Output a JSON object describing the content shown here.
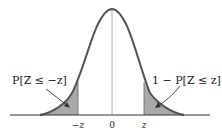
{
  "diagram": {
    "type": "standard-normal-curve",
    "left_tail_label": "P[Z ≤ −z]",
    "right_tail_label": "1 − P[Z ≤ z]",
    "axis_ticks": [
      {
        "label": "−z",
        "x": 78
      },
      {
        "label": "0",
        "x": 112
      },
      {
        "label": "z",
        "x": 144
      }
    ],
    "colors": {
      "curve": "#555555",
      "shade": "#a9a9a9",
      "axis": "#333333",
      "text": "#222222"
    }
  }
}
